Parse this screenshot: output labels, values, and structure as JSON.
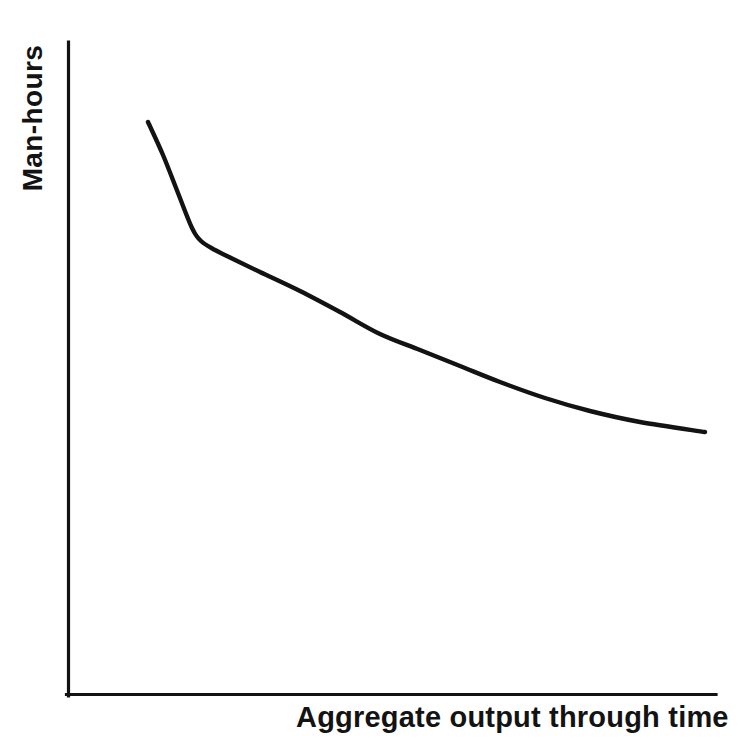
{
  "figure": {
    "background_color": "#ffffff",
    "ink_color": "#131313"
  },
  "axes": {
    "y_label": "Man-hours",
    "x_label": "Aggregate output through time",
    "axis_color": "#131313",
    "origin": {
      "x": 68,
      "y": 695
    },
    "y_axis_top": {
      "x": 68,
      "y": 42
    },
    "x_axis_right": {
      "x": 716,
      "y": 695
    }
  },
  "curve": {
    "name": "learning-curve",
    "color": "#131313",
    "stroke_width": 4.4,
    "points": [
      {
        "x": 148,
        "y": 122
      },
      {
        "x": 163,
        "y": 155
      },
      {
        "x": 178,
        "y": 193
      },
      {
        "x": 192,
        "y": 228
      },
      {
        "x": 201,
        "y": 241
      },
      {
        "x": 215,
        "y": 250
      },
      {
        "x": 231,
        "y": 258
      },
      {
        "x": 260,
        "y": 272
      },
      {
        "x": 300,
        "y": 291
      },
      {
        "x": 340,
        "y": 312
      },
      {
        "x": 380,
        "y": 334
      },
      {
        "x": 420,
        "y": 350
      },
      {
        "x": 460,
        "y": 366
      },
      {
        "x": 500,
        "y": 382
      },
      {
        "x": 545,
        "y": 398
      },
      {
        "x": 590,
        "y": 411
      },
      {
        "x": 640,
        "y": 422
      },
      {
        "x": 705,
        "y": 432
      }
    ]
  },
  "chart_data": {
    "type": "line",
    "title": "",
    "subtitle": "",
    "xlabel": "Aggregate output through time",
    "ylabel": "Man-hours",
    "grid": false,
    "legend": false,
    "legend_position": "none",
    "axis_ticks": {
      "x": [],
      "y": []
    },
    "xlim": [
      0,
      1
    ],
    "ylim": [
      0,
      1
    ],
    "annotations": [],
    "series": [
      {
        "name": "Learning curve",
        "color": "#131313",
        "comment": "Normalized unit-space coordinates read off the plotted curve; x=0 at y-axis, x=1 at right end of x-axis, y=0 at x-axis, y=1 at top of y-axis.",
        "x": [
          0.124,
          0.147,
          0.17,
          0.191,
          0.205,
          0.227,
          0.252,
          0.296,
          0.358,
          0.42,
          0.481,
          0.543,
          0.605,
          0.667,
          0.736,
          0.806,
          0.883,
          0.983
        ],
        "y": [
          0.877,
          0.827,
          0.769,
          0.715,
          0.695,
          0.681,
          0.669,
          0.648,
          0.618,
          0.586,
          0.553,
          0.528,
          0.504,
          0.479,
          0.455,
          0.435,
          0.418,
          0.403
        ]
      }
    ]
  }
}
